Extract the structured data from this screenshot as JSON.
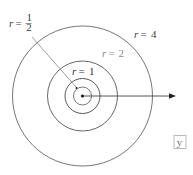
{
  "diagram": {
    "center": {
      "x": 82.5,
      "y": 96
    },
    "circles": [
      {
        "name": "circle-r-half",
        "r": 9,
        "color": "#555555",
        "label_r": "r",
        "label_eq": "=",
        "label_val": "1/2"
      },
      {
        "name": "circle-r-1",
        "r": 17.5,
        "color": "#444444",
        "label_r": "r",
        "label_eq": "=",
        "label_val": "1"
      },
      {
        "name": "circle-r-2",
        "r": 35,
        "color": "#555555",
        "label_r": "r",
        "label_eq": "=",
        "label_val": "2"
      },
      {
        "name": "circle-r-4",
        "r": 70,
        "color": "#555555",
        "label_r": "r",
        "label_eq": "=",
        "label_val": "4"
      }
    ],
    "labels": {
      "r_half": {
        "r": "r",
        "eq": "=",
        "num": "1",
        "den": "2"
      },
      "r_1": {
        "r": "r",
        "eq": "=",
        "val": "1"
      },
      "r_2": {
        "r": "r",
        "eq": "=",
        "val": "2"
      },
      "r_4": {
        "r": "r",
        "eq": "=",
        "val": "4"
      }
    },
    "axis_label": "y",
    "colors": {
      "line_dark": "#333333",
      "line_mid": "#666666",
      "label_dark": "#333333",
      "label_light": "#888888",
      "box_border": "#aaaaaa",
      "box_text": "#777777"
    }
  }
}
